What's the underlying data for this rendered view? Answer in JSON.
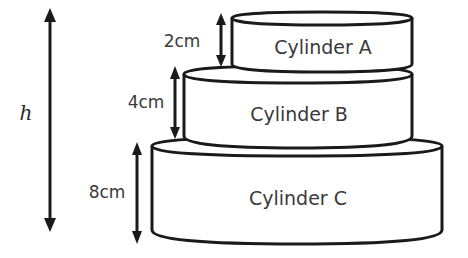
{
  "diagram": {
    "type": "stacked-cylinders",
    "total_height_label": "h",
    "colors": {
      "stroke": "#1a1a1a",
      "text": "#3a3a3a",
      "fill": "#ffffff"
    },
    "cylinders": [
      {
        "id": "A",
        "label": "Cylinder A",
        "height_label": "2cm"
      },
      {
        "id": "B",
        "label": "Cylinder B",
        "height_label": "4cm"
      },
      {
        "id": "C",
        "label": "Cylinder C",
        "height_label": "8cm"
      }
    ]
  }
}
